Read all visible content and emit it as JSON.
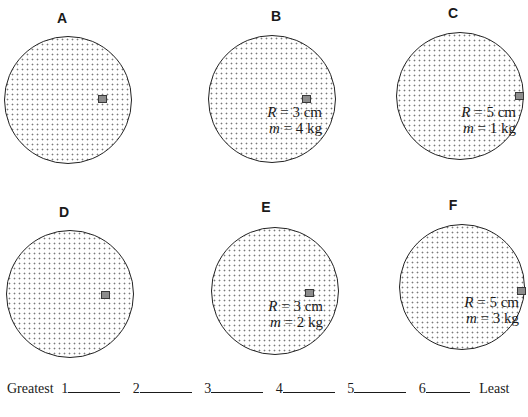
{
  "diagram": {
    "type": "rotating disks with coin placed at distance R from center",
    "panels": [
      {
        "id": "A",
        "label": "A",
        "R_label": "R",
        "R_value": "= 2 cm",
        "m_label": "m",
        "m_value": "= 6 kg",
        "disk": {
          "cx": 68,
          "cy": 100,
          "r": 64
        },
        "coin": {
          "x": 98,
          "y": 95
        },
        "text": {
          "right": 60,
          "top": 103
        },
        "label_pos": {
          "x": 62,
          "y": 11
        }
      },
      {
        "id": "B",
        "label": "B",
        "R_label": "R",
        "R_value": "= 3 cm",
        "m_label": "m",
        "m_value": "= 4 kg",
        "disk": {
          "cx": 272,
          "cy": 99,
          "r": 64
        },
        "coin": {
          "x": 302,
          "y": 95
        },
        "text": {
          "right": 206,
          "top": 104
        },
        "label_pos": {
          "x": 276,
          "y": 9
        }
      },
      {
        "id": "C",
        "label": "C",
        "R_label": "R",
        "R_value": "= 5 cm",
        "m_label": "m",
        "m_value": "= 1 kg",
        "disk": {
          "cx": 460,
          "cy": 96,
          "r": 64
        },
        "coin": {
          "x": 515,
          "y": 92
        },
        "text": {
          "right": 12,
          "top": 104
        },
        "label_pos": {
          "x": 453,
          "y": 6
        }
      },
      {
        "id": "D",
        "label": "D",
        "R_label": "R",
        "R_value": "= 2 cm",
        "m_label": "m",
        "m_value": "= 5 kg",
        "disk": {
          "cx": 70,
          "cy": 294,
          "r": 64
        },
        "coin": {
          "x": 101,
          "y": 291
        },
        "text": {
          "right": 57,
          "top": 300
        },
        "label_pos": {
          "x": 64,
          "y": 205
        }
      },
      {
        "id": "E",
        "label": "E",
        "R_label": "R",
        "R_value": "= 3 cm",
        "m_label": "m",
        "m_value": "= 2 kg",
        "disk": {
          "cx": 275,
          "cy": 291,
          "r": 64
        },
        "coin": {
          "x": 305,
          "y": 289
        },
        "text": {
          "right": 205,
          "top": 298
        },
        "label_pos": {
          "x": 266,
          "y": 200
        }
      },
      {
        "id": "F",
        "label": "F",
        "R_label": "R",
        "R_value": "= 5 cm",
        "m_label": "m",
        "m_value": "= 3 kg",
        "disk": {
          "cx": 462,
          "cy": 287,
          "r": 63
        },
        "coin": {
          "x": 517,
          "y": 287
        },
        "text": {
          "right": 9,
          "top": 294
        },
        "label_pos": {
          "x": 453,
          "y": 198
        }
      }
    ]
  },
  "ranking": {
    "start_label": "Greatest",
    "slots": [
      "1",
      "2",
      "3",
      "4",
      "5",
      "6"
    ],
    "end_label": "Least"
  },
  "cut_off_text": "..."
}
